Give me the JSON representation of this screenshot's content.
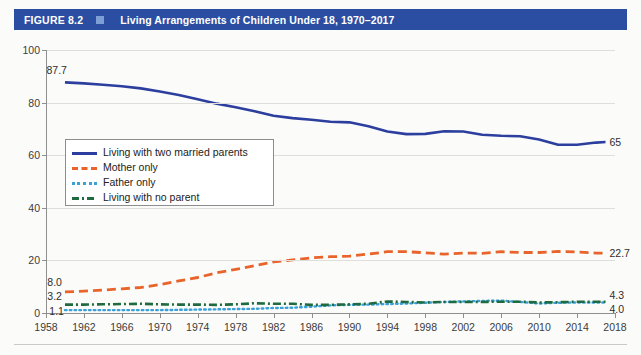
{
  "header": {
    "figure_number": "FIGURE 8.2",
    "separator_icon": "square-icon",
    "title": "Living Arrangements of Children Under 18, 1970–2017",
    "bar_color": "#2b4ea2",
    "square_color": "#7e9ed6",
    "text_color": "#ffffff"
  },
  "chart_data": {
    "type": "line",
    "title": "Living Arrangements of Children Under 18, 1970–2017",
    "xlabel": "",
    "ylabel": "",
    "xlim": [
      1958,
      2018
    ],
    "ylim": [
      0,
      100
    ],
    "grid": true,
    "legend_position": "inner-left",
    "x_ticks": [
      1958,
      1962,
      1966,
      1970,
      1974,
      1978,
      1982,
      1986,
      1990,
      1994,
      1998,
      2002,
      2006,
      2010,
      2014,
      2018
    ],
    "y_ticks": [
      0,
      20,
      40,
      60,
      80,
      100
    ],
    "series": [
      {
        "name": "Living with two married parents",
        "color": "#2d3f9e",
        "style": "solid",
        "start_label": "87.7",
        "end_label": "65",
        "x": [
          1960,
          1962,
          1964,
          1966,
          1968,
          1970,
          1972,
          1974,
          1976,
          1978,
          1980,
          1982,
          1984,
          1986,
          1988,
          1990,
          1992,
          1994,
          1996,
          1998,
          2000,
          2002,
          2004,
          2006,
          2008,
          2010,
          2012,
          2014,
          2016,
          2017
        ],
        "values": [
          87.7,
          87.3,
          86.8,
          86.2,
          85.4,
          84.2,
          82.9,
          81.3,
          79.6,
          78.2,
          76.7,
          75.0,
          74.1,
          73.5,
          72.7,
          72.5,
          71.0,
          69.0,
          68.0,
          68.1,
          69.1,
          69.0,
          67.8,
          67.4,
          67.2,
          66.0,
          64.0,
          64.0,
          64.8,
          65.0
        ]
      },
      {
        "name": "Mother only",
        "color": "#e8642a",
        "style": "dashed",
        "start_label": "8.0",
        "end_label": "22.7",
        "x": [
          1960,
          1962,
          1964,
          1966,
          1968,
          1970,
          1972,
          1974,
          1976,
          1978,
          1980,
          1982,
          1984,
          1986,
          1988,
          1990,
          1992,
          1994,
          1996,
          1998,
          2000,
          2002,
          2004,
          2006,
          2008,
          2010,
          2012,
          2014,
          2016,
          2017
        ],
        "values": [
          8.0,
          8.3,
          8.7,
          9.2,
          9.7,
          10.8,
          12.2,
          13.5,
          15.3,
          16.6,
          18.0,
          19.4,
          20.2,
          21.0,
          21.4,
          21.6,
          22.4,
          23.3,
          23.3,
          22.9,
          22.4,
          22.8,
          22.7,
          23.3,
          23.0,
          23.0,
          23.4,
          23.2,
          22.8,
          22.7
        ]
      },
      {
        "name": "Father only",
        "color": "#3aa0d8",
        "style": "dotted",
        "start_label": "1.1",
        "end_label": "4.0",
        "x": [
          1960,
          1962,
          1964,
          1966,
          1968,
          1970,
          1972,
          1974,
          1976,
          1978,
          1980,
          1982,
          1984,
          1986,
          1988,
          1990,
          1992,
          1994,
          1996,
          1998,
          2000,
          2002,
          2004,
          2006,
          2008,
          2010,
          2012,
          2014,
          2016,
          2017
        ],
        "values": [
          1.1,
          1.1,
          1.1,
          1.1,
          1.1,
          1.1,
          1.2,
          1.3,
          1.4,
          1.5,
          1.6,
          1.9,
          2.0,
          2.4,
          2.9,
          3.1,
          3.2,
          3.4,
          3.6,
          3.9,
          4.2,
          4.4,
          4.6,
          4.7,
          4.2,
          3.6,
          3.9,
          4.0,
          4.0,
          4.0
        ]
      },
      {
        "name": "Living with no parent",
        "color": "#1f6b3f",
        "style": "dashdot",
        "start_label": "3.2",
        "end_label": "4.3",
        "x": [
          1960,
          1962,
          1964,
          1966,
          1968,
          1970,
          1972,
          1974,
          1976,
          1978,
          1980,
          1982,
          1984,
          1986,
          1988,
          1990,
          1992,
          1994,
          1996,
          1998,
          2000,
          2002,
          2004,
          2006,
          2008,
          2010,
          2012,
          2014,
          2016,
          2017
        ],
        "values": [
          3.2,
          3.2,
          3.3,
          3.4,
          3.5,
          3.3,
          3.2,
          3.2,
          3.1,
          3.3,
          3.7,
          3.5,
          3.5,
          3.1,
          3.1,
          3.3,
          3.5,
          4.4,
          4.2,
          4.0,
          4.2,
          4.2,
          4.2,
          4.3,
          4.3,
          4.0,
          4.1,
          4.3,
          4.3,
          4.3
        ]
      }
    ]
  },
  "legend": {
    "items": [
      {
        "label": "Living with two married parents",
        "swatch": "solid-line-swatch"
      },
      {
        "label": "Mother only",
        "swatch": "dashed-line-swatch"
      },
      {
        "label": "Father only",
        "swatch": "dotted-line-swatch"
      },
      {
        "label": "Living with no parent",
        "swatch": "dashdot-line-swatch"
      }
    ]
  }
}
